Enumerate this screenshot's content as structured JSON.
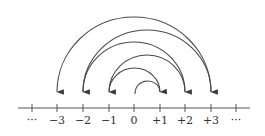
{
  "diagram": {
    "axis": {
      "labels": [
        "···",
        "−3",
        "−2",
        "−1",
        "0",
        "+1",
        "+2",
        "+3",
        "···"
      ],
      "values": [
        null,
        -3,
        -2,
        -1,
        0,
        1,
        2,
        3,
        null
      ]
    },
    "jumps": [
      {
        "from": 0,
        "to": 1,
        "arrow": true
      },
      {
        "from": 1,
        "to": -1,
        "arrow": true
      },
      {
        "from": -1,
        "to": 2,
        "arrow": true
      },
      {
        "from": 2,
        "to": -2,
        "arrow": true
      },
      {
        "from": -2,
        "to": 3,
        "arrow": true
      },
      {
        "from": 3,
        "to": -3,
        "arrow": true
      }
    ],
    "colors": {
      "stroke": "#4a4a4a",
      "text": "#333333",
      "background": "#ffffff"
    }
  }
}
